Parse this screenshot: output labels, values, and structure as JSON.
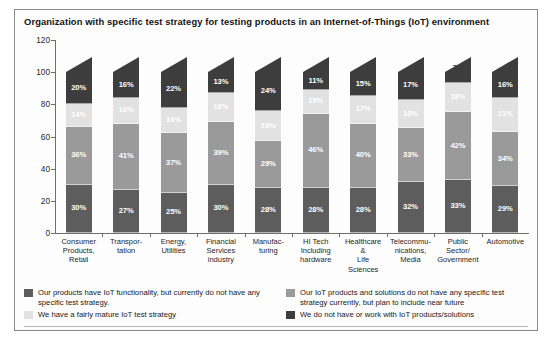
{
  "title": "Organization with specific test strategy for testing products in an Internet-of-Things (IoT) environment",
  "axis": {
    "yticks": [
      "0",
      "20",
      "40",
      "60",
      "80",
      "100",
      "120"
    ]
  },
  "colors": {
    "series_1": "#5d5d5d",
    "series_2": "#9a9a9a",
    "series_3": "#e2e2e2",
    "series_4": "#3d3d3d",
    "frame": "#8a8a8a",
    "axis": "#6f6f6f",
    "background": "#fdfdfd"
  },
  "legend": {
    "items": [
      {
        "label": "Our products have IoT functionality, but currently do not have any specific test strategy.",
        "color": "#5d5d5d"
      },
      {
        "label": "Our IoT products and solutions do not have any specific test strategy currently, but plan to include near future",
        "color": "#9a9a9a"
      },
      {
        "label": "We have a fairly mature IoT test strategy",
        "color": "#e2e2e2"
      },
      {
        "label": "We do not  have or work with  IoT products/solutions",
        "color": "#3d3d3d"
      }
    ]
  },
  "chart_data": {
    "type": "bar",
    "stacked": true,
    "title": "Organization with specific test strategy for testing products in an Internet-of-Things (IoT) environment",
    "xlabel": "",
    "ylabel": "",
    "ylim": [
      0,
      120
    ],
    "ytick_step": 20,
    "grid": false,
    "legend_position": "bottom",
    "categories": [
      "Consumer Products, Retail",
      "Transpor-tation",
      "Energy, Utilities",
      "Financial Services industry",
      "Manufac-turing",
      "HI Tech Including hardware",
      "Healthcare & Life Sciences",
      "Telecommu-nications, Media",
      "Public Sector/ Government",
      "Automotive"
    ],
    "category_lines": [
      [
        "Consumer",
        "Products,",
        "Retail"
      ],
      [
        "Transpor-",
        "tation"
      ],
      [
        "Energy,",
        "Utilities"
      ],
      [
        "Financial",
        "Services",
        "industry"
      ],
      [
        "Manufac-",
        "turing"
      ],
      [
        "HI Tech",
        "Including",
        "hardware"
      ],
      [
        "Healthcare",
        "&",
        "Life",
        "Sciences"
      ],
      [
        "Telecommu-",
        "nications,",
        "Media"
      ],
      [
        "Public",
        "Sector/",
        "Government"
      ],
      [
        "Automotive"
      ]
    ],
    "series": [
      {
        "name": "Our products have IoT functionality, but currently do not have any specific test strategy.",
        "color": "#5d5d5d",
        "values": [
          30,
          27,
          25,
          30,
          28,
          28,
          28,
          32,
          33,
          29
        ],
        "labels": [
          "30%",
          "27%",
          "25%",
          "30%",
          "28%",
          "28%",
          "28%",
          "32%",
          "33%",
          "29%"
        ]
      },
      {
        "name": "Our IoT products and solutions do not have any specific test strategy currently, but plan to include near future",
        "color": "#9a9a9a",
        "values": [
          36,
          41,
          37,
          39,
          29,
          46,
          40,
          33,
          42,
          34
        ],
        "labels": [
          "36%",
          "41%",
          "37%",
          "39%",
          "29%",
          "46%",
          "40%",
          "33%",
          "42%",
          "34%"
        ]
      },
      {
        "name": "We have a fairly mature IoT test strategy",
        "color": "#e2e2e2",
        "values": [
          14,
          16,
          16,
          18,
          19,
          15,
          17,
          18,
          18,
          21
        ],
        "labels": [
          "14%",
          "16%",
          "16%",
          "18%",
          "19%",
          "15%",
          "17%",
          "18%",
          "18%",
          "21%"
        ]
      },
      {
        "name": "We do not  have or work with  IoT products/solutions",
        "color": "#3d3d3d",
        "values": [
          20,
          16,
          22,
          13,
          24,
          11,
          15,
          17,
          7,
          16
        ],
        "labels": [
          "20%",
          "16%",
          "22%",
          "13%",
          "24%",
          "11%",
          "15%",
          "17%",
          "7%",
          "16%"
        ]
      }
    ]
  }
}
